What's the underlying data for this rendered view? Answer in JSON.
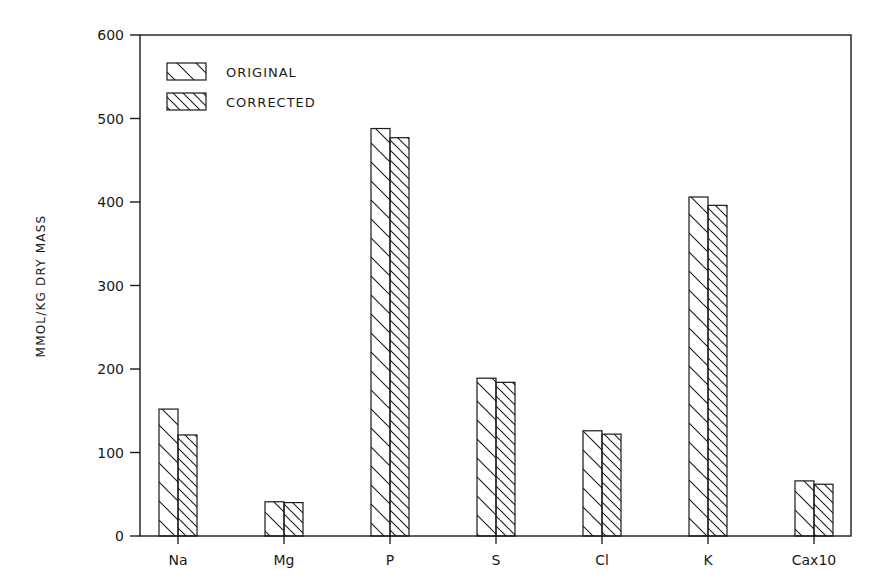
{
  "chart_data": {
    "type": "bar",
    "title": "",
    "xlabel": "",
    "ylabel": "MMOL/KG DRY MASS",
    "ylim": [
      0,
      600
    ],
    "yticks": [
      0,
      100,
      200,
      300,
      400,
      500,
      600
    ],
    "grid": false,
    "legend_position": "upper-left-inside",
    "categories": [
      "Na",
      "Mg",
      "P",
      "S",
      "Cl",
      "K",
      "Cax10"
    ],
    "series": [
      {
        "name": "ORIGINAL",
        "pattern": "sparse-diagonal-hatch",
        "values": [
          152,
          41,
          488,
          189,
          126,
          406,
          66
        ]
      },
      {
        "name": "CORRECTED",
        "pattern": "dense-diagonal-hatch",
        "values": [
          121,
          40,
          477,
          184,
          122,
          396,
          62
        ]
      }
    ]
  },
  "colors": {
    "ink": "#1a1a1a",
    "background": "#ffffff"
  }
}
